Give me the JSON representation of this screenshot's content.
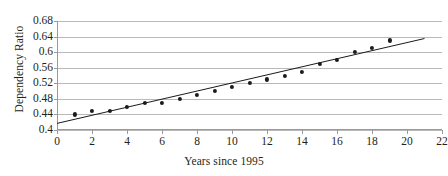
{
  "chart_data": {
    "type": "scatter",
    "title": "",
    "xlabel": "Years since 1995",
    "ylabel": "Dependency Ratio",
    "xlim": [
      0,
      22
    ],
    "ylim": [
      0.4,
      0.68
    ],
    "x_ticks": [
      0,
      2,
      4,
      6,
      8,
      10,
      12,
      14,
      16,
      18,
      20,
      22
    ],
    "x_tick_labels": [
      "0",
      "2",
      "4",
      "6",
      "8",
      "10",
      "12",
      "14",
      "16",
      "18",
      "20",
      "22"
    ],
    "y_ticks": [
      0.4,
      0.44,
      0.48,
      0.52,
      0.56,
      0.6,
      0.64,
      0.68
    ],
    "y_tick_labels": [
      "0.4",
      "0.44",
      "0.48",
      "0.52",
      "0.56",
      "0.6",
      "0.64",
      "0.68"
    ],
    "grid": "horizontal",
    "legend": "none",
    "x": [
      1,
      2,
      3,
      4,
      5,
      6,
      7,
      8,
      9,
      10,
      11,
      12,
      13,
      14,
      15,
      16,
      17,
      18,
      19
    ],
    "values": [
      0.44,
      0.45,
      0.45,
      0.46,
      0.47,
      0.47,
      0.48,
      0.49,
      0.5,
      0.51,
      0.52,
      0.53,
      0.54,
      0.55,
      0.57,
      0.58,
      0.6,
      0.61,
      0.63
    ],
    "series": [
      {
        "name": "Dependency Ratio",
        "type": "scatter",
        "marker": "filled-circle",
        "color": "#1a1a1a",
        "values": [
          0.44,
          0.45,
          0.45,
          0.46,
          0.47,
          0.47,
          0.48,
          0.49,
          0.5,
          0.51,
          0.52,
          0.53,
          0.54,
          0.55,
          0.57,
          0.58,
          0.6,
          0.61,
          0.63
        ]
      },
      {
        "name": "Trend line",
        "type": "line",
        "color": "#1a1a1a",
        "x_range": [
          0,
          21
        ],
        "y_range": [
          0.417,
          0.635
        ]
      }
    ],
    "point_labels": [
      "x=1, y=0.44",
      "x=2, y=0.45",
      "x=3, y=0.45",
      "x=4, y=0.46",
      "x=5, y=0.47",
      "x=6, y=0.47",
      "x=7, y=0.48",
      "x=8, y=0.49",
      "x=9, y=0.50",
      "x=10, y=0.51",
      "x=11, y=0.52",
      "x=12, y=0.53",
      "x=13, y=0.54",
      "x=14, y=0.55",
      "x=15, y=0.57",
      "x=16, y=0.58",
      "x=17, y=0.60",
      "x=18, y=0.61",
      "x=19, y=0.63"
    ]
  },
  "colors": {
    "marker": "#1a1a1a",
    "trend_line": "#1a1a1a",
    "gridline": "#b9b9b9",
    "axis": "#9a9a9a",
    "text": "#231f20",
    "background": "#ffffff"
  }
}
